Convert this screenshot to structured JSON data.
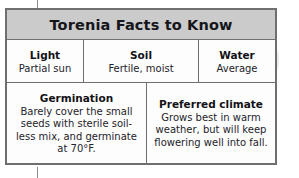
{
  "table": {
    "title": "Torenia Facts to Know",
    "basics": [
      {
        "label": "Light",
        "value": "Partial sun"
      },
      {
        "label": "Soil",
        "value": "Fertile, moist"
      },
      {
        "label": "Water",
        "value": "Average"
      }
    ],
    "details": [
      {
        "heading": "Germination",
        "body": "Barely cover the small seeds with sterile soil-less mix, and germinate at 70°F."
      },
      {
        "heading": "Preferred climate",
        "body": "Grows best in warm weather, but will keep flowering well into fall."
      }
    ]
  },
  "colors": {
    "header_background": "#cbcbcb",
    "border": "#6f6f6f",
    "cell_background": "#fdfdfd",
    "text": "#121217"
  }
}
